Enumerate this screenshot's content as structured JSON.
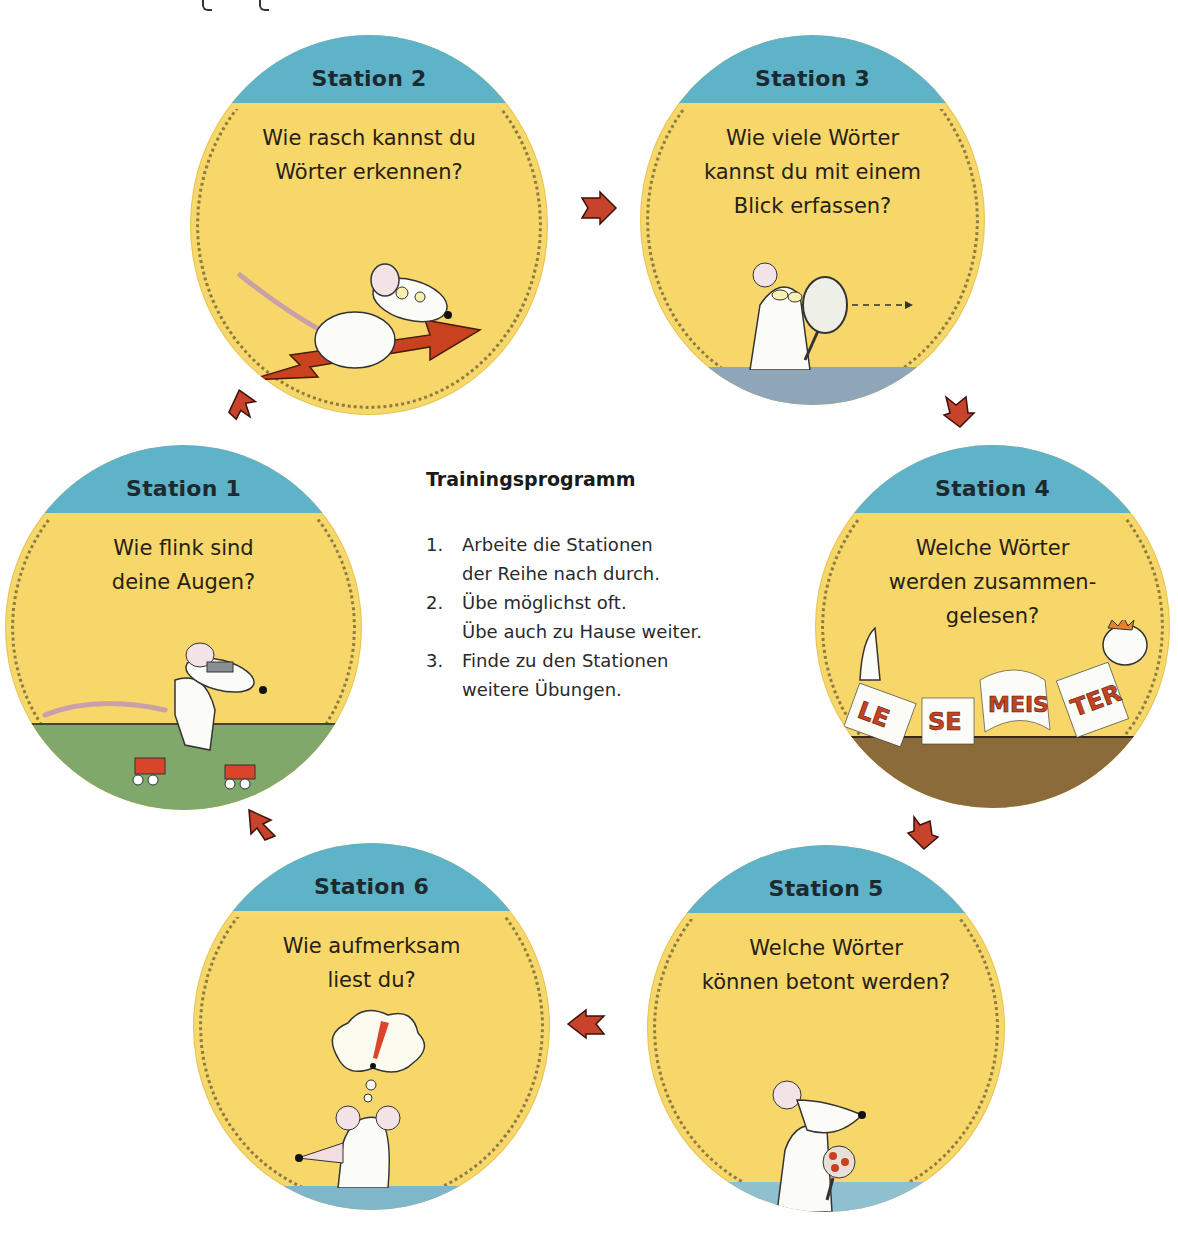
{
  "page": {
    "background": "#ffffff",
    "colors": {
      "circle_fill": "#f7d86a",
      "circle_header": "#5fb3c9",
      "arrow": "#c8432b",
      "ground_green": "#7fa86a",
      "ground_brown": "#8c6b3a",
      "ground_blue": "#7fb6c9"
    }
  },
  "program": {
    "heading": "Trainingsprogramm",
    "items": [
      {
        "number": "1.",
        "lines": [
          "Arbeite die Stationen",
          "der Reihe nach durch."
        ]
      },
      {
        "number": "2.",
        "lines": [
          "Übe möglichst oft.",
          "Übe auch zu Hause weiter."
        ]
      },
      {
        "number": "3.",
        "lines": [
          "Finde zu den Stationen",
          "weitere Übungen."
        ]
      }
    ]
  },
  "stations": [
    {
      "title": "Station 1",
      "question": [
        "Wie flink sind",
        "deine Augen?"
      ],
      "illustration": "mouse-on-roller-skates-icon"
    },
    {
      "title": "Station 2",
      "question": [
        "Wie rasch kannst du",
        "Wörter erkennen?"
      ],
      "illustration": "mouse-riding-arrow-icon"
    },
    {
      "title": "Station 3",
      "question": [
        "Wie viele Wörter",
        "kannst du mit einem",
        "Blick erfassen?"
      ],
      "illustration": "mouse-with-magnifier-icon"
    },
    {
      "title": "Station 4",
      "question": [
        "Welche Wörter",
        "werden zusammen-",
        "gelesen?"
      ],
      "illustration": "lesemeister-worm-icon",
      "banner_syllables": [
        "LE",
        "SE",
        "MEIS",
        "TER"
      ]
    },
    {
      "title": "Station 5",
      "question": [
        "Welche Wörter",
        "können betont werden?"
      ],
      "illustration": "mouse-with-microphone-icon"
    },
    {
      "title": "Station 6",
      "question": [
        "Wie aufmerksam",
        "liest du?"
      ],
      "illustration": "mouse-thinking-exclamation-icon",
      "thought_symbol": "!"
    }
  ],
  "arrows": [
    {
      "from": "Station 1",
      "to": "Station 2",
      "direction": "up"
    },
    {
      "from": "Station 2",
      "to": "Station 3",
      "direction": "right"
    },
    {
      "from": "Station 3",
      "to": "Station 4",
      "direction": "down"
    },
    {
      "from": "Station 4",
      "to": "Station 5",
      "direction": "down"
    },
    {
      "from": "Station 5",
      "to": "Station 6",
      "direction": "left"
    },
    {
      "from": "Station 6",
      "to": "Station 1",
      "direction": "up"
    }
  ]
}
